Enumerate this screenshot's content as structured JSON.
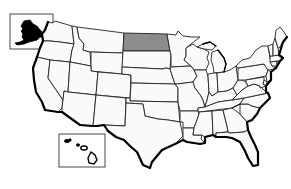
{
  "map": {
    "title": "United States",
    "highlight_color": "#8c8c8c",
    "default_fill": "#fafafa",
    "border_color": "#222222",
    "highlighted_state": "North Dakota",
    "insets": [
      "Alaska",
      "Hawaii"
    ],
    "states": [
      {
        "id": "WA",
        "name": "Washington"
      },
      {
        "id": "OR",
        "name": "Oregon"
      },
      {
        "id": "CA",
        "name": "California"
      },
      {
        "id": "ID",
        "name": "Idaho"
      },
      {
        "id": "NV",
        "name": "Nevada"
      },
      {
        "id": "MT",
        "name": "Montana"
      },
      {
        "id": "WY",
        "name": "Wyoming"
      },
      {
        "id": "UT",
        "name": "Utah"
      },
      {
        "id": "AZ",
        "name": "Arizona"
      },
      {
        "id": "CO",
        "name": "Colorado"
      },
      {
        "id": "NM",
        "name": "New Mexico"
      },
      {
        "id": "ND",
        "name": "North Dakota",
        "highlighted": true
      },
      {
        "id": "SD",
        "name": "South Dakota"
      },
      {
        "id": "NE",
        "name": "Nebraska"
      },
      {
        "id": "KS",
        "name": "Kansas"
      },
      {
        "id": "OK",
        "name": "Oklahoma"
      },
      {
        "id": "TX",
        "name": "Texas"
      },
      {
        "id": "MN",
        "name": "Minnesota"
      },
      {
        "id": "IA",
        "name": "Iowa"
      },
      {
        "id": "MO",
        "name": "Missouri"
      },
      {
        "id": "AR",
        "name": "Arkansas"
      },
      {
        "id": "LA",
        "name": "Louisiana"
      },
      {
        "id": "WI",
        "name": "Wisconsin"
      },
      {
        "id": "IL",
        "name": "Illinois"
      },
      {
        "id": "MI",
        "name": "Michigan"
      },
      {
        "id": "IN",
        "name": "Indiana"
      },
      {
        "id": "OH",
        "name": "Ohio"
      },
      {
        "id": "KY",
        "name": "Kentucky"
      },
      {
        "id": "TN",
        "name": "Tennessee"
      },
      {
        "id": "MS",
        "name": "Mississippi"
      },
      {
        "id": "AL",
        "name": "Alabama"
      },
      {
        "id": "GA",
        "name": "Georgia"
      },
      {
        "id": "FL",
        "name": "Florida"
      },
      {
        "id": "SC",
        "name": "South Carolina"
      },
      {
        "id": "NC",
        "name": "North Carolina"
      },
      {
        "id": "VA",
        "name": "Virginia"
      },
      {
        "id": "WV",
        "name": "West Virginia"
      },
      {
        "id": "PA",
        "name": "Pennsylvania"
      },
      {
        "id": "NY",
        "name": "New York"
      },
      {
        "id": "NJ",
        "name": "New Jersey"
      },
      {
        "id": "DE",
        "name": "Delaware"
      },
      {
        "id": "MD",
        "name": "Maryland"
      },
      {
        "id": "CT",
        "name": "Connecticut"
      },
      {
        "id": "RI",
        "name": "Rhode Island"
      },
      {
        "id": "MA",
        "name": "Massachusetts"
      },
      {
        "id": "VT",
        "name": "Vermont"
      },
      {
        "id": "NH",
        "name": "New Hampshire"
      },
      {
        "id": "ME",
        "name": "Maine"
      },
      {
        "id": "AK",
        "name": "Alaska"
      },
      {
        "id": "HI",
        "name": "Hawaii"
      }
    ]
  }
}
